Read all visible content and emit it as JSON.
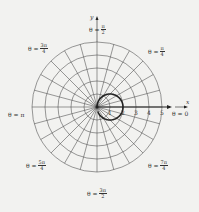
{
  "diagram": {
    "type": "polar-grid",
    "center": [
      97,
      107
    ],
    "unit_px": 13,
    "rings": [
      1,
      2,
      3,
      4,
      5
    ],
    "spoke_step_deg": 15,
    "curve": {
      "equation": "r = 2cos(theta)",
      "color": "#222222"
    },
    "colors": {
      "grid": "#555555",
      "axis": "#222222",
      "background": "#f2f2f0"
    }
  },
  "axes": {
    "x_label": "x",
    "y_label": "y"
  },
  "ticks": [
    "1",
    "2",
    "3",
    "4",
    "5"
  ],
  "angle_labels": {
    "theta0": {
      "prefix": "θ = 0"
    },
    "pi_over_4": {
      "prefix": "θ =",
      "num": "π",
      "den": "4"
    },
    "pi_over_2": {
      "prefix": "θ =",
      "num": "π",
      "den": "2"
    },
    "three_pi_over_4": {
      "prefix": "θ =",
      "num": "3π",
      "den": "4"
    },
    "pi": {
      "prefix": "θ = π"
    },
    "five_pi_over_4": {
      "prefix": "θ =",
      "num": "5π",
      "den": "4"
    },
    "three_pi_over_2": {
      "prefix": "θ =",
      "num": "3π",
      "den": "2"
    },
    "seven_pi_over_4": {
      "prefix": "θ =",
      "num": "7π",
      "den": "4"
    }
  }
}
